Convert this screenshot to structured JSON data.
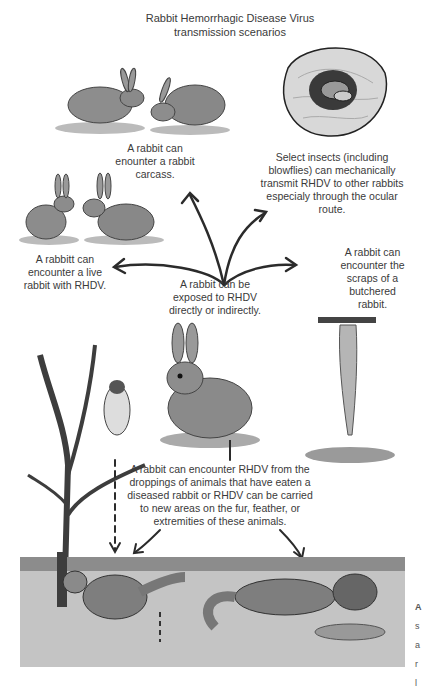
{
  "title": "Rabbit Hemorrhagic Disease Virus transmission scenarios",
  "title_lines": [
    "Rabbit Hemorrhagic Disease Virus",
    "transmission scenarios"
  ],
  "center": {
    "lines": [
      "A rabbit can be",
      "exposed to RHDV",
      "directly or indirectly."
    ]
  },
  "scenarios": [
    {
      "id": "carcass",
      "lines": [
        "A rabbit can",
        "enounter a rabbit",
        "carcass."
      ],
      "icon": "rabbit-carcass-illustration"
    },
    {
      "id": "insects",
      "lines": [
        "Select insects (including",
        "blowflies) can mechanically",
        "transmit RHDV to other rabbits",
        "especialy through the ocular",
        "route."
      ],
      "icon": "fly-in-eye-illustration"
    },
    {
      "id": "live",
      "lines": [
        "A rabbitt can",
        "encounter a live",
        "rabbit with RHDV."
      ],
      "icon": "two-rabbits-illustration"
    },
    {
      "id": "butchered",
      "lines": [
        "A rabbit can",
        "encounter the",
        "scraps of a",
        "butchered",
        "rabbit."
      ],
      "icon": "hanging-rabbit-illustration"
    },
    {
      "id": "droppings",
      "lines": [
        "A rabbit can encounter RHDV from the",
        "droppings of animals that have eaten a",
        "diseased rabbit or RHDV can be carried",
        "to new areas on the fur, feather, or",
        "extremities of these animals."
      ],
      "icon": "predators-illustration"
    }
  ],
  "edge_cutoff_letters": [
    "A",
    "s",
    "a",
    "r",
    "l"
  ],
  "colors": {
    "background": "#ffffff",
    "text": "#3a3a3a",
    "ink": "#2b2b2b",
    "shade": "#9a9a9a"
  }
}
